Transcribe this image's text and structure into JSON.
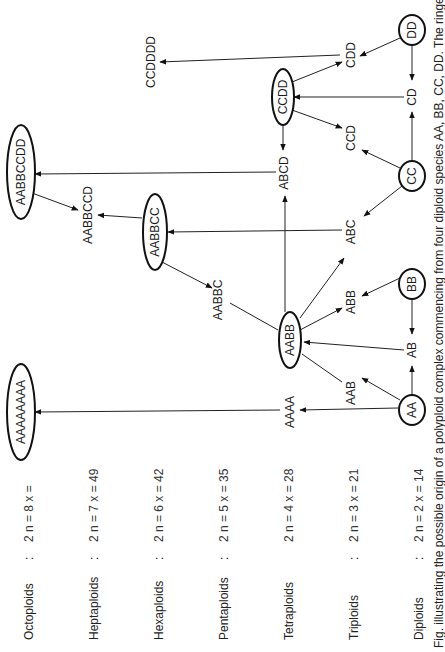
{
  "figure": {
    "caption": "Fig. illustrating the possible origin of a polyploid complex commencing from four diploid species AA, BB, CC, DD. The ringed",
    "ploidy_levels": [
      {
        "label": "Octoploids",
        "sep": ":",
        "formula": "2 n = 8 x ="
      },
      {
        "label": "Heptaploids",
        "sep": ":",
        "formula": "2 n = 7 x = 49"
      },
      {
        "label": "Hexaploids",
        "sep": ":",
        "formula": "2 n = 6 x = 42"
      },
      {
        "label": "Pentaploids",
        "sep": ":",
        "formula": "2 n = 5 x = 35"
      },
      {
        "label": "Tetraploids",
        "sep": "",
        "formula": "2 n = 4 x = 28"
      },
      {
        "label": "Triploids",
        "sep": ":",
        "formula": "2 n = 3 x = 21"
      },
      {
        "label": "Diploids",
        "sep": ":",
        "formula": "2 n = 2 x = 14"
      }
    ],
    "nodes": {
      "AABBCCDD": "AABBCCDD",
      "AAAAAAAA": "AAAAAAAA",
      "CCDDDD": "CCDDDD",
      "AABBCCD": "AABBCCD",
      "AABBCC": "AABBCC",
      "AABBC": "AABBC",
      "AABB": "AABB",
      "ABCD": "ABCD",
      "CCDD": "CCDD",
      "CCD": "CCD",
      "CDD": "CDD",
      "CD": "CD",
      "DD": "DD",
      "CC": "CC",
      "ABC": "ABC",
      "BB": "BB",
      "ABB": "ABB",
      "AB": "AB",
      "AAB": "AAB",
      "AAAA": "AAAA",
      "AA": "AA"
    },
    "ringed_nodes": [
      "AABBCCDD",
      "AAAAAAAA",
      "AABBCC",
      "AABB",
      "CCDD",
      "DD",
      "CC",
      "BB",
      "AA"
    ],
    "edges": [
      [
        "AA",
        "AAAA"
      ],
      [
        "AAAA",
        "AAAAAAAA"
      ],
      [
        "AA",
        "AAB"
      ],
      [
        "AA",
        "AB"
      ],
      [
        "BB",
        "AB"
      ],
      [
        "AB",
        "AABB"
      ],
      [
        "AAB",
        "AABB"
      ],
      [
        "AABB",
        "ABB"
      ],
      [
        "BB",
        "ABB"
      ],
      [
        "AABB",
        "ABC"
      ],
      [
        "CC",
        "ABC"
      ],
      [
        "ABC",
        "AABBCC"
      ],
      [
        "AABB",
        "ABCD"
      ],
      [
        "CCDD",
        "ABCD"
      ],
      [
        "ABCD",
        "AABBCCDD"
      ],
      [
        "AABB",
        "AABBC"
      ],
      [
        "AABBCC",
        "AABBC"
      ],
      [
        "AABBCC",
        "AABBCCD"
      ],
      [
        "AABBCCDD",
        "AABBCCD"
      ],
      [
        "CC",
        "CD"
      ],
      [
        "DD",
        "CD"
      ],
      [
        "CD",
        "CCDD"
      ],
      [
        "CC",
        "CCD"
      ],
      [
        "CCDD",
        "CCD"
      ],
      [
        "CCDD",
        "CDD"
      ],
      [
        "DD",
        "CDD"
      ],
      [
        "CDD",
        "CCDDDD"
      ]
    ]
  }
}
